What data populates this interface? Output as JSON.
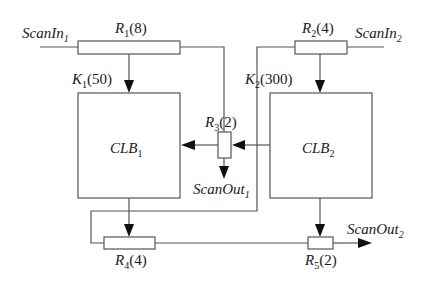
{
  "diagram": {
    "type": "scan-chain circuit block diagram",
    "inputs": [
      {
        "name": "ScanIn",
        "sub": "1"
      },
      {
        "name": "ScanIn",
        "sub": "2"
      }
    ],
    "outputs": [
      {
        "name": "ScanOut",
        "sub": "1"
      },
      {
        "name": "ScanOut",
        "sub": "2"
      }
    ],
    "blocks": [
      {
        "name": "CLB",
        "sub": "1"
      },
      {
        "name": "CLB",
        "sub": "2"
      }
    ],
    "resistors": [
      {
        "name": "R",
        "sub": "1",
        "value": "(8)"
      },
      {
        "name": "R",
        "sub": "2",
        "value": "(4)"
      },
      {
        "name": "R",
        "sub": "3",
        "value": "(2)"
      },
      {
        "name": "R",
        "sub": "4",
        "value": "(4)"
      },
      {
        "name": "R",
        "sub": "5",
        "value": "(2)"
      }
    ],
    "k_labels": [
      {
        "name": "K",
        "sub": "1",
        "value": "(50)"
      },
      {
        "name": "K",
        "sub": "2",
        "value": "(300)"
      }
    ],
    "edges": [
      {
        "from": "ScanIn_1",
        "to": "R_1"
      },
      {
        "from": "R_1",
        "to": "CLB_1",
        "label": "K_1(50)"
      },
      {
        "from": "R_1",
        "to": "R_3"
      },
      {
        "from": "ScanIn_2",
        "to": "R_2"
      },
      {
        "from": "R_2",
        "to": "CLB_2",
        "label": "K_2(300)"
      },
      {
        "from": "R_2",
        "to": "R_4"
      },
      {
        "from": "CLB_2",
        "to": "R_3"
      },
      {
        "from": "R_3",
        "to": "CLB_1"
      },
      {
        "from": "R_3",
        "to": "ScanOut_1"
      },
      {
        "from": "CLB_1",
        "to": "R_4"
      },
      {
        "from": "R_4",
        "to": "R_5"
      },
      {
        "from": "CLB_2",
        "to": "R_5"
      },
      {
        "from": "R_5",
        "to": "ScanOut_2"
      }
    ]
  }
}
